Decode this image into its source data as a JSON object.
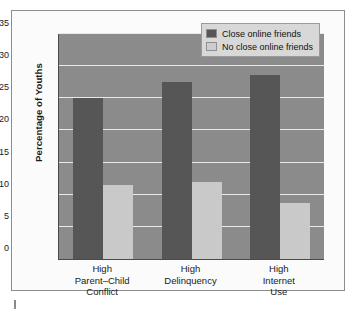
{
  "chart_data": {
    "type": "bar",
    "title": "",
    "xlabel": "",
    "ylabel": "Percentage of Youths",
    "ylim": [
      0,
      35
    ],
    "yticks": [
      0,
      5,
      10,
      15,
      20,
      25,
      30,
      35
    ],
    "grid": true,
    "legend_position": "top-right",
    "categories": [
      "High\nParent–Child\nConflict",
      "High\nDelinquency",
      "High\nInternet\nUse"
    ],
    "category_lines": [
      [
        "High",
        "Parent–Child",
        "Conflict"
      ],
      [
        "High",
        "Delinquency"
      ],
      [
        "High",
        "Internet",
        "Use"
      ]
    ],
    "series": [
      {
        "name": "Close online friends",
        "color": "#565656",
        "values": [
          25.0,
          27.5,
          28.6
        ]
      },
      {
        "name": "No close online friends",
        "color": "#c9c9c9",
        "values": [
          11.5,
          12.0,
          8.7
        ]
      }
    ]
  },
  "legend": {
    "items": [
      {
        "label": "Close online friends",
        "swatch": "dark"
      },
      {
        "label": "No close online friends",
        "swatch": "light"
      }
    ]
  },
  "colors": {
    "plot_background": "#8b8b8b",
    "figure_background": "#fbfbfb",
    "gridline": "#e9e9e9",
    "axis": "#4a4a4a",
    "series_dark": "#565656",
    "series_light": "#c9c9c9",
    "legend_background": "#d8d8d8"
  }
}
